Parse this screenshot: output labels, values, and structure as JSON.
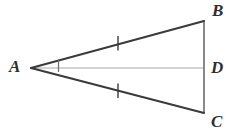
{
  "figure": {
    "kind": "geometry-diagram",
    "background_color": "#ffffff",
    "width": 237,
    "height": 134
  },
  "labels": {
    "a": "A",
    "b": "B",
    "c": "C",
    "d": "D"
  },
  "colors": {
    "stroke_dark": "#3a3a3a",
    "stroke_mid": "#6b6b6b",
    "stroke_light": "#a8a8a8",
    "label_color": "#2e2e2e"
  },
  "chart_data": {
    "type": "diagram",
    "title": "",
    "points": [
      {
        "name": "A",
        "x": 31,
        "y": 68,
        "label": "A",
        "label_x": 9,
        "label_y": 58
      },
      {
        "name": "B",
        "x": 204,
        "y": 21,
        "label": "B",
        "label_x": 212,
        "label_y": 2
      },
      {
        "name": "D",
        "x": 204,
        "y": 68,
        "label": "D",
        "label_x": 211,
        "label_y": 59
      },
      {
        "name": "C",
        "x": 204,
        "y": 113,
        "label": "C",
        "label_x": 211,
        "label_y": 113
      }
    ],
    "segments": [
      {
        "name": "AB",
        "from": "A",
        "to": "B",
        "x1": 31,
        "y1": 68,
        "x2": 204,
        "y2": 21,
        "color": "#3a3a3a",
        "width": 2.0
      },
      {
        "name": "AC",
        "from": "A",
        "to": "C",
        "x1": 31,
        "y1": 68,
        "x2": 204,
        "y2": 113,
        "color": "#3a3a3a",
        "width": 2.0
      },
      {
        "name": "BC",
        "from": "B",
        "to": "C",
        "x1": 204,
        "y1": 21,
        "x2": 204,
        "y2": 113,
        "color": "#6b6b6b",
        "width": 1.6
      },
      {
        "name": "AD",
        "from": "A",
        "to": "D",
        "x1": 31,
        "y1": 68,
        "x2": 204,
        "y2": 68,
        "color": "#a8a8a8",
        "width": 1.0
      }
    ],
    "congruence_ticks": [
      {
        "name": "tick-AB",
        "on_segment": "AB",
        "x": 118,
        "y": 43.2,
        "count": 1
      },
      {
        "name": "tick-AC",
        "on_segment": "AC",
        "x": 118,
        "y": 90.6,
        "count": 1
      }
    ],
    "angle_marks": [
      {
        "name": "angle-bisector-mark-A",
        "at_vertex": "A",
        "x": 58.5,
        "y1": 60.5,
        "y2": 71.5
      }
    ]
  }
}
